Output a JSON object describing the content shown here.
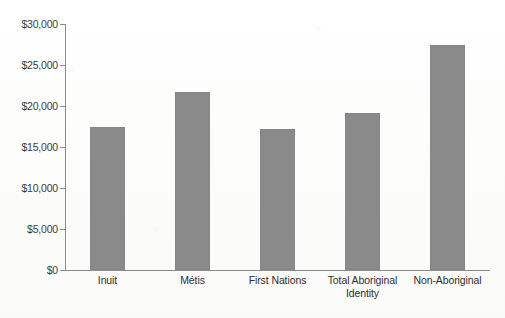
{
  "chart_data": {
    "type": "bar",
    "title": "",
    "subtitle": "",
    "xlabel": "",
    "ylabel": "",
    "categories": [
      "Inuit",
      "Métis",
      "First Nations",
      "Total Aboriginal Identity",
      "Non-Aboriginal"
    ],
    "category_lines": [
      [
        "Inuit"
      ],
      [
        "Métis"
      ],
      [
        "First Nations"
      ],
      [
        "Total Aboriginal",
        "Identity"
      ],
      [
        "Non-Aboriginal"
      ]
    ],
    "values": [
      17400,
      21700,
      17200,
      19100,
      27500
    ],
    "ylim": [
      0,
      30000
    ],
    "ytick_values": [
      0,
      5000,
      10000,
      15000,
      20000,
      25000,
      30000
    ],
    "ytick_labels": [
      "$0",
      "$5,000",
      "$10,000",
      "$15,000",
      "$20,000",
      "$25,000",
      "$30,000"
    ],
    "grid": false,
    "legend": false,
    "legend_position": "none",
    "bar_color": "#8a8a8a",
    "axis_color": "#8c8c8c",
    "text_color": "#2f2f2f",
    "background_color": "#fdfdfc"
  }
}
